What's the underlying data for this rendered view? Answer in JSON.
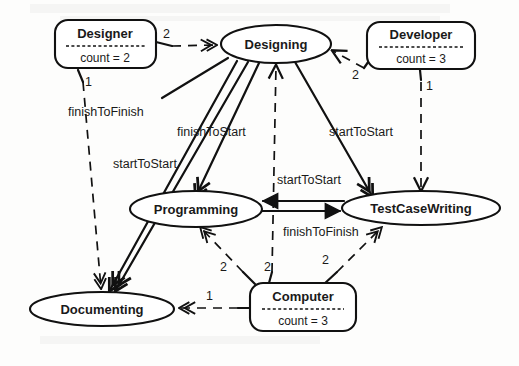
{
  "diagram": {
    "type": "uml-object-collaboration-diagram",
    "background_color": "#fdfdfc",
    "line_color": "#111111",
    "activities": [
      {
        "id": "designing",
        "label": "Designing",
        "cx": 276,
        "cy": 44,
        "rx": 55,
        "ry": 19
      },
      {
        "id": "programming",
        "label": "Programming",
        "cx": 196,
        "cy": 209,
        "rx": 66,
        "ry": 18
      },
      {
        "id": "testcasewriting",
        "label": "TestCaseWriting",
        "cx": 421,
        "cy": 208,
        "rx": 79,
        "ry": 17
      },
      {
        "id": "documenting",
        "label": "Documenting",
        "cx": 102,
        "cy": 309,
        "rx": 72,
        "ry": 17
      }
    ],
    "resources": [
      {
        "id": "designer",
        "title": "Designer",
        "attribute": "count = 2",
        "x": 55,
        "y": 20,
        "w": 101,
        "h": 48
      },
      {
        "id": "developer",
        "title": "Developer",
        "attribute": "count = 3",
        "x": 367,
        "y": 22,
        "w": 108,
        "h": 47
      },
      {
        "id": "computer",
        "title": "Computer",
        "attribute": "count = 3",
        "x": 250,
        "y": 283,
        "w": 106,
        "h": 48
      }
    ],
    "edge_labels": [
      {
        "id": "lbl-fin-to-fin-left",
        "text": "finishToFinish",
        "x": 68,
        "y": 116
      },
      {
        "id": "lbl-start-to-start-left",
        "text": "startToStart",
        "x": 113,
        "y": 168
      },
      {
        "id": "lbl-finish-to-start",
        "text": "finishToStart",
        "x": 177,
        "y": 136
      },
      {
        "id": "lbl-start-to-start-right",
        "text": "startToStart",
        "x": 329,
        "y": 136
      },
      {
        "id": "lbl-start-to-start-mid",
        "text": "startToStart",
        "x": 277,
        "y": 184
      },
      {
        "id": "lbl-finish-to-finish-mid",
        "text": "finishToFinish",
        "x": 283,
        "y": 236
      }
    ],
    "multiplicities": [
      {
        "id": "mult-designer-designing",
        "text": "2",
        "x": 163,
        "y": 38
      },
      {
        "id": "mult-designer-documenting",
        "text": "1",
        "x": 85,
        "y": 86
      },
      {
        "id": "mult-developer-designing",
        "text": "2",
        "x": 364,
        "y": 74
      },
      {
        "id": "mult-developer-testcase",
        "text": "1",
        "x": 414,
        "y": 88
      },
      {
        "id": "mult-computer-programming",
        "text": "2",
        "x": 223,
        "y": 267
      },
      {
        "id": "mult-computer-designing",
        "text": "2",
        "x": 265,
        "y": 267
      },
      {
        "id": "mult-computer-testcase",
        "text": "2",
        "x": 325,
        "y": 262
      },
      {
        "id": "mult-computer-documenting",
        "text": "1",
        "x": 208,
        "y": 298
      }
    ]
  }
}
